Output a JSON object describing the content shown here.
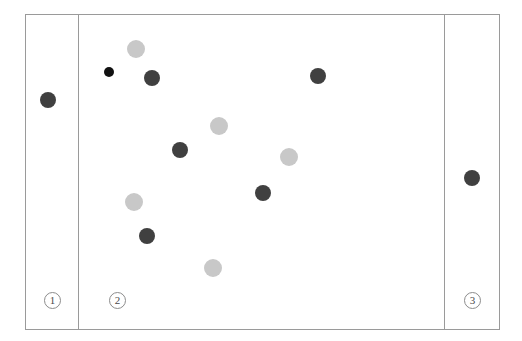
{
  "figure": {
    "kind": "scatter-plot-three-panels",
    "canvas": {
      "width": 522,
      "height": 341,
      "background": "#ffffff"
    },
    "frame": {
      "x": 25,
      "y": 14,
      "width": 475,
      "height": 316,
      "border_color": "#9a9a9a"
    },
    "dividers": [
      {
        "name": "divider-1-2",
        "x": 78,
        "y": 14,
        "height": 316,
        "color": "#9a9a9a"
      },
      {
        "name": "divider-2-3",
        "x": 444,
        "y": 14,
        "height": 316,
        "color": "#9a9a9a"
      }
    ],
    "panels": [
      {
        "id": "panel-1",
        "label": "1",
        "label_x": 44,
        "label_y": 292
      },
      {
        "id": "panel-2",
        "label": "2",
        "label_x": 109,
        "label_y": 292
      },
      {
        "id": "panel-3",
        "label": "3",
        "label_x": 464,
        "label_y": 292
      }
    ],
    "colors": {
      "dot_dark": "#404040",
      "dot_light": "#c8c8c8",
      "dot_black": "#111111",
      "line": "#9a9a9a"
    }
  },
  "chart_data": {
    "type": "scatter",
    "title": "",
    "xlabel": "",
    "ylabel": "",
    "grid": false,
    "legend": "none",
    "xlim": [
      25,
      500
    ],
    "ylim": [
      14,
      330
    ],
    "panel_labels": [
      "1",
      "2",
      "3"
    ],
    "panel_boundaries_x": [
      25,
      78,
      444,
      500
    ],
    "series": [
      {
        "name": "dark",
        "color": "#404040",
        "points": [
          {
            "panel": 1,
            "x": 48,
            "y": 100,
            "r": 8
          },
          {
            "panel": 2,
            "x": 152,
            "y": 78,
            "r": 8
          },
          {
            "panel": 2,
            "x": 180,
            "y": 150,
            "r": 8
          },
          {
            "panel": 2,
            "x": 263,
            "y": 193,
            "r": 8
          },
          {
            "panel": 2,
            "x": 318,
            "y": 76,
            "r": 8
          },
          {
            "panel": 2,
            "x": 147,
            "y": 236,
            "r": 8
          },
          {
            "panel": 3,
            "x": 472,
            "y": 178,
            "r": 8
          }
        ]
      },
      {
        "name": "light",
        "color": "#c8c8c8",
        "points": [
          {
            "panel": 2,
            "x": 136,
            "y": 49,
            "r": 9
          },
          {
            "panel": 2,
            "x": 219,
            "y": 126,
            "r": 9
          },
          {
            "panel": 2,
            "x": 289,
            "y": 157,
            "r": 9
          },
          {
            "panel": 2,
            "x": 134,
            "y": 202,
            "r": 9
          },
          {
            "panel": 2,
            "x": 213,
            "y": 268,
            "r": 9
          }
        ]
      },
      {
        "name": "black-small",
        "color": "#111111",
        "points": [
          {
            "panel": 2,
            "x": 109,
            "y": 72,
            "r": 5
          }
        ]
      }
    ],
    "counts": {
      "dark": 7,
      "light": 5,
      "black": 1,
      "total": 13
    }
  }
}
